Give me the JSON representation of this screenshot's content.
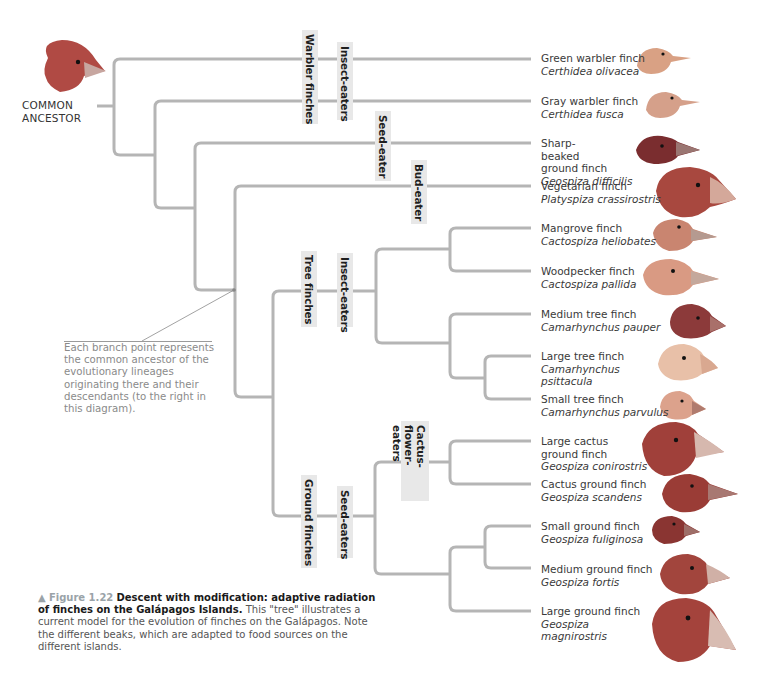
{
  "ancestor": {
    "label_line1": "COMMON",
    "label_line2": "ANCESTOR"
  },
  "group_labels": {
    "warbler_finches": "Warbler finches",
    "warbler_insect_eaters": "Insect-eaters",
    "seed_eater": "Seed-eater",
    "bud_eater": "Bud-eater",
    "tree_finches": "Tree finches",
    "tree_insect_eaters": "Insect-eaters",
    "ground_finches": "Ground finches",
    "seed_eaters": "Seed-eaters",
    "cactus_flower_eaters": "Cactus-flower-eaters"
  },
  "species": [
    {
      "common": "Green warbler finch",
      "scientific": "Certhidea olivacea",
      "color": "#d9a184"
    },
    {
      "common": "Gray warbler finch",
      "scientific": "Certhidea fusca",
      "color": "#d5a08a"
    },
    {
      "common": "Sharp-beaked ground finch",
      "scientific": "Geospiza difficilis",
      "color": "#7a2d2f"
    },
    {
      "common": "Vegetarian finch",
      "scientific": "Platyspiza crassirostris",
      "color": "#a8483f"
    },
    {
      "common": "Mangrove finch",
      "scientific": "Cactospiza heliobates",
      "color": "#c98570"
    },
    {
      "common": "Woodpecker finch",
      "scientific": "Cactospiza pallida",
      "color": "#d99a83"
    },
    {
      "common": "Medium tree finch",
      "scientific": "Camarhynchus pauper",
      "color": "#8c3a3a"
    },
    {
      "common": "Large tree finch",
      "scientific": "Camarhynchus psittacula",
      "color": "#e8c0a8"
    },
    {
      "common": "Small tree finch",
      "scientific": "Camarhynchus parvulus",
      "color": "#dca28c"
    },
    {
      "common": "Large cactus ground finch",
      "scientific": "Geospiza conirostris",
      "color": "#a0403a"
    },
    {
      "common": "Cactus ground finch",
      "scientific": "Geospiza scandens",
      "color": "#9a3c36"
    },
    {
      "common": "Small ground finch",
      "scientific": "Geospiza fuliginosa",
      "color": "#8a3532"
    },
    {
      "common": "Medium ground finch",
      "scientific": "Geospiza fortis",
      "color": "#a2453d"
    },
    {
      "common": "Large ground finch",
      "scientific": "Geospiza magnirostris",
      "color": "#a4433c"
    }
  ],
  "annotation": {
    "text": "Each branch point represents the common ancestor of the evolutionary lineages originating there and their descendants (to the right in this diagram)."
  },
  "caption": {
    "marker": "▲",
    "figure_number": "Figure 1.22",
    "title": "Descent with modification: adaptive radiation of finches on the Galápagos Islands.",
    "body": "This \"tree\" illustrates a current model for the evolution of finches on the Galápagos. Note the different beaks, which are adapted to food sources on the different islands."
  },
  "colors": {
    "branch": "#b5b5b5",
    "label_bg": "#e8e8e8",
    "ancestor_bird": "#b04a44"
  }
}
